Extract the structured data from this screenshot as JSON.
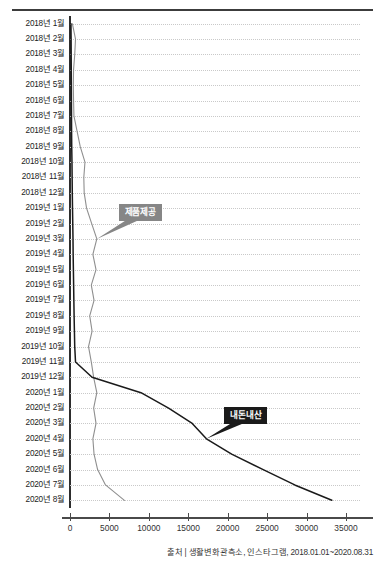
{
  "source_note": "출처 | 생활변화관측소, 인스타그램, 2018.01.01~2020.08.31",
  "callouts": {
    "gray_label": "제품제공",
    "dark_label": "내돈내산"
  },
  "colors": {
    "series_gray": "#8f8f8f",
    "series_black": "#1a1a1a",
    "gridline": "#c9c9c9",
    "axis": "#2d2d2d",
    "callout_gray_bg": "#868686",
    "callout_dark_bg": "#1a1a1a"
  },
  "chart_data": {
    "type": "line",
    "title": "",
    "xlabel": "",
    "ylabel": "",
    "orientation": "horizontal",
    "grid": true,
    "legend": "annotated-callouts",
    "xlim": [
      0,
      35000
    ],
    "xticks": [
      0,
      5000,
      10000,
      15000,
      20000,
      25000,
      30000,
      35000
    ],
    "xticklabels": [
      "0",
      "5000",
      "10000",
      "15000",
      "20000",
      "25000",
      "30000",
      "35000"
    ],
    "categories": [
      "2018년 1월",
      "2018년 2월",
      "2018년 3월",
      "2018년 4월",
      "2018년 5월",
      "2018년 6월",
      "2018년 7월",
      "2018년 8월",
      "2018년 9월",
      "2018년 10월",
      "2018년 11월",
      "2018년 12월",
      "2019년 1월",
      "2019년 2월",
      "2019년 3월",
      "2019년 4월",
      "2019년 5월",
      "2019년 6월",
      "2019년 7월",
      "2019년 8월",
      "2019년 9월",
      "2019년 10월",
      "2019년 11월",
      "2019년 12월",
      "2020년 1월",
      "2020년 2월",
      "2020년 3월",
      "2020년 4월",
      "2020년 5월",
      "2020년 6월",
      "2020년 7월",
      "2020년 8월"
    ],
    "series": [
      {
        "name": "제품제공",
        "color": "#8f8f8f",
        "values": [
          300,
          700,
          600,
          450,
          420,
          450,
          500,
          900,
          1300,
          1900,
          1750,
          1800,
          2100,
          2750,
          3400,
          2900,
          3300,
          2700,
          3050,
          2500,
          2800,
          2350,
          2700,
          3000,
          3400,
          3000,
          3300,
          2900,
          3050,
          3500,
          4500,
          6900
        ]
      },
      {
        "name": "내돈내산",
        "color": "#1a1a1a",
        "values": [
          120,
          140,
          150,
          160,
          170,
          180,
          190,
          200,
          220,
          250,
          270,
          290,
          320,
          350,
          380,
          400,
          430,
          460,
          490,
          520,
          560,
          600,
          700,
          2800,
          9000,
          12500,
          15500,
          17300,
          20500,
          24500,
          28500,
          33200
        ]
      }
    ],
    "annotations": [
      {
        "label": "제품제공",
        "series": "제품제공",
        "category": "2019년 3월"
      },
      {
        "label": "내돈내산",
        "series": "내돈내산",
        "category": "2020년 4월"
      }
    ]
  }
}
